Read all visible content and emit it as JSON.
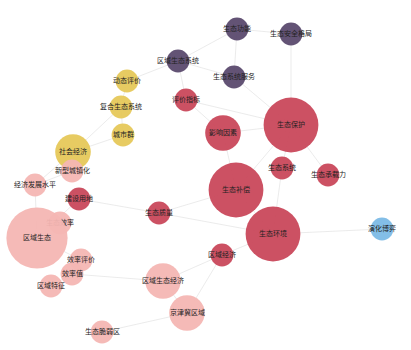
{
  "graph": {
    "type": "keyword-cooccurrence-network",
    "clusters": {
      "purple": "#5b4a6e",
      "yellow": "#e6c85a",
      "red": "#c9485b",
      "pink": "#f4b6b3",
      "blue": "#7cbbe6"
    },
    "nodes": [
      {
        "id": "n1",
        "label": "生态功能",
        "cluster": "purple",
        "weight": 2
      },
      {
        "id": "n2",
        "label": "生态安全格局",
        "cluster": "purple",
        "weight": 2
      },
      {
        "id": "n3",
        "label": "区域生态系统",
        "cluster": "purple",
        "weight": 2
      },
      {
        "id": "n4",
        "label": "生态系统服务",
        "cluster": "purple",
        "weight": 2
      },
      {
        "id": "n5",
        "label": "动态评价",
        "cluster": "yellow",
        "weight": 2
      },
      {
        "id": "n6",
        "label": "复合生态系统",
        "cluster": "yellow",
        "weight": 2
      },
      {
        "id": "n7",
        "label": "城市群",
        "cluster": "yellow",
        "weight": 2
      },
      {
        "id": "n8",
        "label": "社会经济",
        "cluster": "yellow",
        "weight": 4
      },
      {
        "id": "n9",
        "label": "评价指标",
        "cluster": "red",
        "weight": 2
      },
      {
        "id": "n10",
        "label": "影响因素",
        "cluster": "red",
        "weight": 4
      },
      {
        "id": "n11",
        "label": "生态保护",
        "cluster": "red",
        "weight": 7
      },
      {
        "id": "n12",
        "label": "生态系统",
        "cluster": "red",
        "weight": 2
      },
      {
        "id": "n13",
        "label": "生态承载力",
        "cluster": "red",
        "weight": 2
      },
      {
        "id": "n14",
        "label": "生态补偿",
        "cluster": "red",
        "weight": 7
      },
      {
        "id": "n15",
        "label": "生态环境",
        "cluster": "red",
        "weight": 7
      },
      {
        "id": "n16",
        "label": "生态质量",
        "cluster": "red",
        "weight": 2
      },
      {
        "id": "n17",
        "label": "区域经济",
        "cluster": "red",
        "weight": 2
      },
      {
        "id": "n18",
        "label": "建设用地",
        "cluster": "red",
        "weight": 2
      },
      {
        "id": "n19",
        "label": "新型城镇化",
        "cluster": "pink",
        "weight": 2
      },
      {
        "id": "n20",
        "label": "经济发展水平",
        "cluster": "pink",
        "weight": 2
      },
      {
        "id": "n21",
        "label": "生态效率",
        "cluster": "pink",
        "weight": 2
      },
      {
        "id": "n22",
        "label": "区域生态",
        "cluster": "pink",
        "weight": 8
      },
      {
        "id": "n23",
        "label": "效率评价",
        "cluster": "pink",
        "weight": 2
      },
      {
        "id": "n24",
        "label": "效率值",
        "cluster": "pink",
        "weight": 2
      },
      {
        "id": "n25",
        "label": "区域特征",
        "cluster": "pink",
        "weight": 2
      },
      {
        "id": "n26",
        "label": "区域生态经济",
        "cluster": "pink",
        "weight": 4
      },
      {
        "id": "n27",
        "label": "京津冀区域",
        "cluster": "pink",
        "weight": 4
      },
      {
        "id": "n28",
        "label": "生态脆弱区",
        "cluster": "pink",
        "weight": 2
      },
      {
        "id": "n29",
        "label": "演化博弈",
        "cluster": "blue",
        "weight": 2
      }
    ],
    "edges": [
      [
        "n1",
        "n2"
      ],
      [
        "n1",
        "n3"
      ],
      [
        "n1",
        "n4"
      ],
      [
        "n3",
        "n4"
      ],
      [
        "n2",
        "n11"
      ],
      [
        "n3",
        "n5"
      ],
      [
        "n3",
        "n9"
      ],
      [
        "n4",
        "n11"
      ],
      [
        "n5",
        "n6"
      ],
      [
        "n6",
        "n7"
      ],
      [
        "n6",
        "n8"
      ],
      [
        "n7",
        "n8"
      ],
      [
        "n8",
        "n19"
      ],
      [
        "n8",
        "n20"
      ],
      [
        "n9",
        "n10"
      ],
      [
        "n9",
        "n11"
      ],
      [
        "n10",
        "n11"
      ],
      [
        "n10",
        "n14"
      ],
      [
        "n11",
        "n12"
      ],
      [
        "n11",
        "n13"
      ],
      [
        "n11",
        "n14"
      ],
      [
        "n12",
        "n15"
      ],
      [
        "n14",
        "n15"
      ],
      [
        "n15",
        "n16"
      ],
      [
        "n15",
        "n17"
      ],
      [
        "n17",
        "n26"
      ],
      [
        "n17",
        "n27"
      ],
      [
        "n18",
        "n16"
      ],
      [
        "n18",
        "n22"
      ],
      [
        "n19",
        "n20"
      ],
      [
        "n21",
        "n22"
      ],
      [
        "n22",
        "n23"
      ],
      [
        "n23",
        "n24"
      ],
      [
        "n24",
        "n25"
      ],
      [
        "n24",
        "n26"
      ],
      [
        "n26",
        "n27"
      ],
      [
        "n22",
        "n20"
      ],
      [
        "n15",
        "n29"
      ],
      [
        "n14",
        "n16"
      ],
      [
        "n28",
        "n27"
      ]
    ]
  }
}
